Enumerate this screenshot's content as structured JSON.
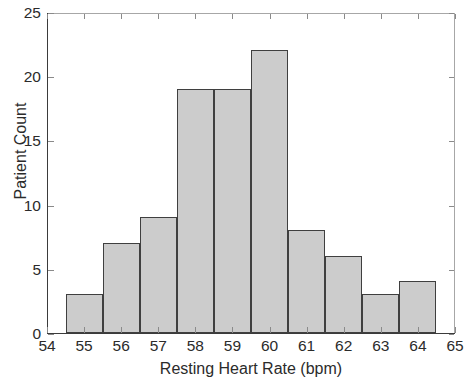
{
  "chart_data": {
    "type": "bar",
    "title": "",
    "subtitle": "",
    "xlabel": "Resting Heart Rate (bpm)",
    "ylabel": "Patient Count",
    "categories": [
      55,
      56,
      57,
      58,
      59,
      60,
      61,
      62,
      63,
      64
    ],
    "values": [
      3,
      7,
      9,
      19,
      19,
      22,
      8,
      6,
      3,
      4
    ],
    "bin_edges": [
      54.5,
      55.5,
      56.5,
      57.5,
      58.5,
      59.5,
      60.5,
      61.5,
      62.5,
      63.5,
      64.5
    ],
    "xlim": [
      54,
      65
    ],
    "ylim": [
      0,
      25
    ],
    "x_ticks": [
      54,
      55,
      56,
      57,
      58,
      59,
      60,
      61,
      62,
      63,
      64,
      65
    ],
    "x_tick_labels": [
      "54",
      "55",
      "56",
      "57",
      "58",
      "59",
      "60",
      "61",
      "62",
      "63",
      "64",
      "65"
    ],
    "y_ticks": [
      0,
      5,
      10,
      15,
      20,
      25
    ],
    "y_tick_labels": [
      "0",
      "5",
      "10",
      "15",
      "20",
      "25"
    ],
    "grid": false,
    "legend": null,
    "bar_fill_color": "#cccccc",
    "bar_edge_color": "#3f3f3f",
    "axis_color": "#3b3b3b",
    "text_color": "#2b2b2b",
    "background_color": "#ffffff"
  }
}
